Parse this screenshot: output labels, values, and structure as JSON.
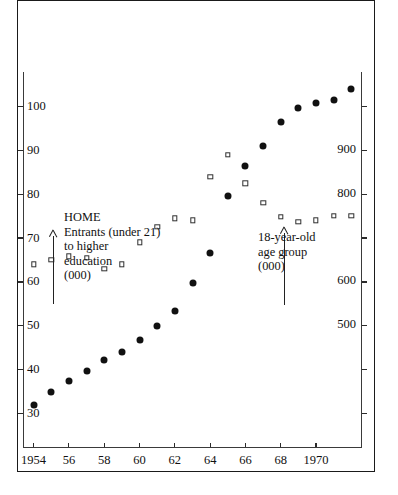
{
  "chart_data": {
    "type": "scatter",
    "title": "",
    "xlabel": "",
    "ylabel": "",
    "xlim": [
      1953.4,
      1972.6
    ],
    "x": [
      1954,
      1955,
      1956,
      1957,
      1958,
      1959,
      1960,
      1961,
      1962,
      1963,
      1964,
      1965,
      1966,
      1967,
      1968,
      1969,
      1970,
      1971,
      1972
    ],
    "grid": false,
    "legend": "none",
    "axes": {
      "left": {
        "name": "HOME Entrants (under 21) to higher education (000)",
        "ticks": [
          30,
          40,
          50,
          60,
          70,
          80,
          90,
          100
        ],
        "tick_labels": [
          "30",
          "40",
          "50",
          "60",
          "70",
          "80",
          "90",
          "100"
        ],
        "range": [
          22.2,
          107.8
        ]
      },
      "right": {
        "name": "18-year-old age group (000)",
        "ticks": [
          300,
          400,
          500,
          600,
          700,
          800,
          900,
          1000
        ],
        "tick_labels": [
          "",
          "",
          "500",
          "600",
          "",
          "800",
          "900",
          ""
        ],
        "range": [
          222,
          1078
        ]
      },
      "bottom": {
        "ticks": [
          1954,
          1956,
          1958,
          1960,
          1962,
          1964,
          1966,
          1968,
          1970
        ],
        "tick_labels": [
          "1954",
          "56",
          "58",
          "60",
          "62",
          "64",
          "66",
          "68",
          "1970"
        ]
      }
    },
    "series": [
      {
        "name": "HOME Entrants (under 21) to higher education (000)",
        "marker": "filled-circle",
        "axis": "left",
        "color": "#111111",
        "values": [
          32.0,
          35.0,
          37.5,
          39.8,
          42.2,
          44.0,
          46.8,
          50.0,
          53.5,
          59.8,
          66.5,
          79.5,
          86.5,
          91.0,
          96.5,
          99.5,
          100.8,
          101.5,
          104.0
        ]
      },
      {
        "name": "18-year-old age group (000)",
        "marker": "open-square",
        "axis": "right",
        "color": "#2f2f2f",
        "values": [
          640,
          650,
          658,
          655,
          630,
          640,
          690,
          725,
          745,
          740,
          840,
          890,
          825,
          780,
          748,
          737,
          740,
          750,
          750
        ]
      }
    ],
    "annotations": [
      {
        "id": "left-annotation",
        "lines": [
          "HOME",
          "Entrants (under 21)",
          "to higher",
          "education",
          "(000)"
        ],
        "arrow": "up"
      },
      {
        "id": "right-annotation",
        "lines": [
          "18-year-old",
          "age group",
          "(000)"
        ],
        "arrow": "up"
      }
    ]
  }
}
